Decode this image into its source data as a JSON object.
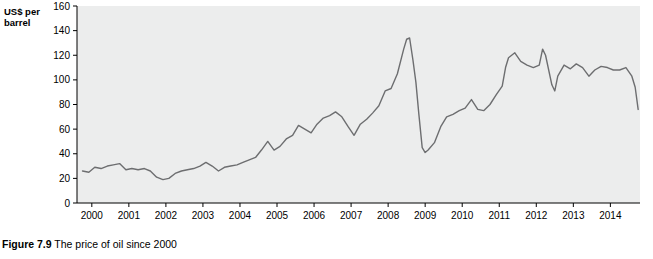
{
  "figure": {
    "caption_label": "Figure 7.9",
    "caption_text": "The price of oil since 2000",
    "axis_title_line1": "US$ per",
    "axis_title_line2": "barrel"
  },
  "chart_data": {
    "type": "line",
    "title": "",
    "xlabel": "",
    "ylabel": "US$ per barrel",
    "ylim": [
      0,
      160
    ],
    "yticks": [
      0,
      20,
      40,
      60,
      80,
      100,
      120,
      140,
      160
    ],
    "xlim": [
      1999.6,
      2014.8
    ],
    "xticks": [
      2000,
      2001,
      2002,
      2003,
      2004,
      2005,
      2006,
      2007,
      2008,
      2009,
      2010,
      2011,
      2012,
      2013,
      2014
    ],
    "xticklabels": [
      "2000",
      "2001",
      "2002",
      "2003",
      "2004",
      "2005",
      "2006",
      "2007",
      "2008",
      "2009",
      "2010",
      "2011",
      "2012",
      "2013",
      "2014"
    ],
    "grid": false,
    "plot_background": "#eceded",
    "line_color": "#6d6e70",
    "series": [
      {
        "name": "Price of oil",
        "x": [
          1999.75,
          1999.92,
          2000.08,
          2000.25,
          2000.42,
          2000.58,
          2000.75,
          2000.92,
          2001.08,
          2001.25,
          2001.42,
          2001.58,
          2001.75,
          2001.92,
          2002.08,
          2002.25,
          2002.42,
          2002.58,
          2002.75,
          2002.92,
          2003.08,
          2003.25,
          2003.42,
          2003.58,
          2003.75,
          2003.92,
          2004.08,
          2004.25,
          2004.42,
          2004.58,
          2004.75,
          2004.92,
          2005.08,
          2005.25,
          2005.42,
          2005.58,
          2005.75,
          2005.92,
          2006.08,
          2006.25,
          2006.42,
          2006.58,
          2006.75,
          2006.92,
          2007.08,
          2007.25,
          2007.42,
          2007.58,
          2007.75,
          2007.92,
          2008.08,
          2008.25,
          2008.42,
          2008.5,
          2008.58,
          2008.67,
          2008.75,
          2008.83,
          2008.92,
          2009.0,
          2009.08,
          2009.25,
          2009.42,
          2009.58,
          2009.75,
          2009.92,
          2010.08,
          2010.25,
          2010.42,
          2010.58,
          2010.75,
          2010.92,
          2011.08,
          2011.17,
          2011.25,
          2011.42,
          2011.58,
          2011.75,
          2011.92,
          2012.08,
          2012.17,
          2012.25,
          2012.42,
          2012.5,
          2012.58,
          2012.75,
          2012.92,
          2013.08,
          2013.25,
          2013.42,
          2013.58,
          2013.75,
          2013.92,
          2014.08,
          2014.25,
          2014.42,
          2014.58,
          2014.67,
          2014.75
        ],
        "y": [
          26,
          25,
          29,
          28,
          30,
          31,
          32,
          27,
          28,
          27,
          28,
          26,
          21,
          19,
          20,
          24,
          26,
          27,
          28,
          30,
          33,
          30,
          26,
          29,
          30,
          31,
          33,
          35,
          37,
          43,
          50,
          43,
          46,
          52,
          55,
          63,
          60,
          57,
          64,
          69,
          71,
          74,
          70,
          62,
          55,
          64,
          68,
          73,
          79,
          91,
          93,
          105,
          125,
          133,
          134,
          116,
          98,
          72,
          45,
          41,
          43,
          49,
          62,
          70,
          72,
          75,
          77,
          84,
          76,
          75,
          80,
          88,
          95,
          110,
          118,
          122,
          115,
          112,
          110,
          112,
          125,
          120,
          96,
          91,
          103,
          112,
          109,
          113,
          110,
          103,
          108,
          111,
          110,
          108,
          108,
          110,
          103,
          94,
          76
        ]
      }
    ]
  }
}
